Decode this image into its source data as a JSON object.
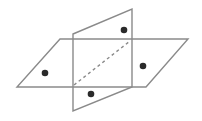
{
  "diagram": {
    "width": 202,
    "height": 121,
    "stroke_color": "#8a8a8a",
    "dot_color": "#2a2a2a",
    "horizontal_plane": {
      "points": "60,39 188,39 146,87 17,87"
    },
    "vertical_plane": {
      "points": "73,34 132,9 132,87 73,111"
    },
    "intersection_dashed_line": {
      "x1": 74,
      "y1": 85,
      "x2": 130,
      "y2": 41
    },
    "points": [
      {
        "name": "point-left",
        "cx": 45,
        "cy": 73
      },
      {
        "name": "point-top",
        "cx": 124,
        "cy": 30
      },
      {
        "name": "point-right",
        "cx": 143,
        "cy": 66
      },
      {
        "name": "point-bottom",
        "cx": 91,
        "cy": 94
      }
    ]
  }
}
